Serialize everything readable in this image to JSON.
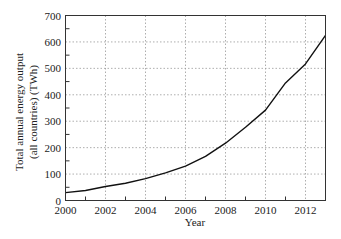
{
  "chart_data": {
    "type": "line",
    "title": "",
    "xlabel": "Year",
    "ylabel_lines": [
      "Total annual energy output",
      "(all countries) (TWh)"
    ],
    "ylabel": "Total annual energy output (all countries) (TWh)",
    "x": [
      2000,
      2001,
      2002,
      2003,
      2004,
      2005,
      2006,
      2007,
      2008,
      2009,
      2010,
      2011,
      2012,
      2013
    ],
    "series": [
      {
        "name": "Total annual energy output",
        "values": [
          30,
          38,
          53,
          65,
          83,
          105,
          130,
          167,
          217,
          277,
          342,
          445,
          517,
          625
        ],
        "color": "#111111"
      }
    ],
    "xlim": [
      2000,
      2013
    ],
    "ylim": [
      0,
      700
    ],
    "x_ticks": [
      2000,
      2002,
      2004,
      2006,
      2008,
      2010,
      2012
    ],
    "x_tick_labels": [
      "2000",
      "2002",
      "2004",
      "2006",
      "2008",
      "2010",
      "2012"
    ],
    "x_minor_ticks": [
      2001,
      2003,
      2005,
      2007,
      2009,
      2011
    ],
    "y_ticks": [
      0,
      100,
      200,
      300,
      400,
      500,
      600,
      700
    ],
    "y_tick_labels": [
      "0",
      "100",
      "200",
      "300",
      "400",
      "500",
      "600",
      "700"
    ],
    "y_minor_ticks": [
      50,
      150,
      250,
      350,
      450,
      550,
      650
    ],
    "grid": true,
    "grid_style": "dotted",
    "legend": "none"
  }
}
